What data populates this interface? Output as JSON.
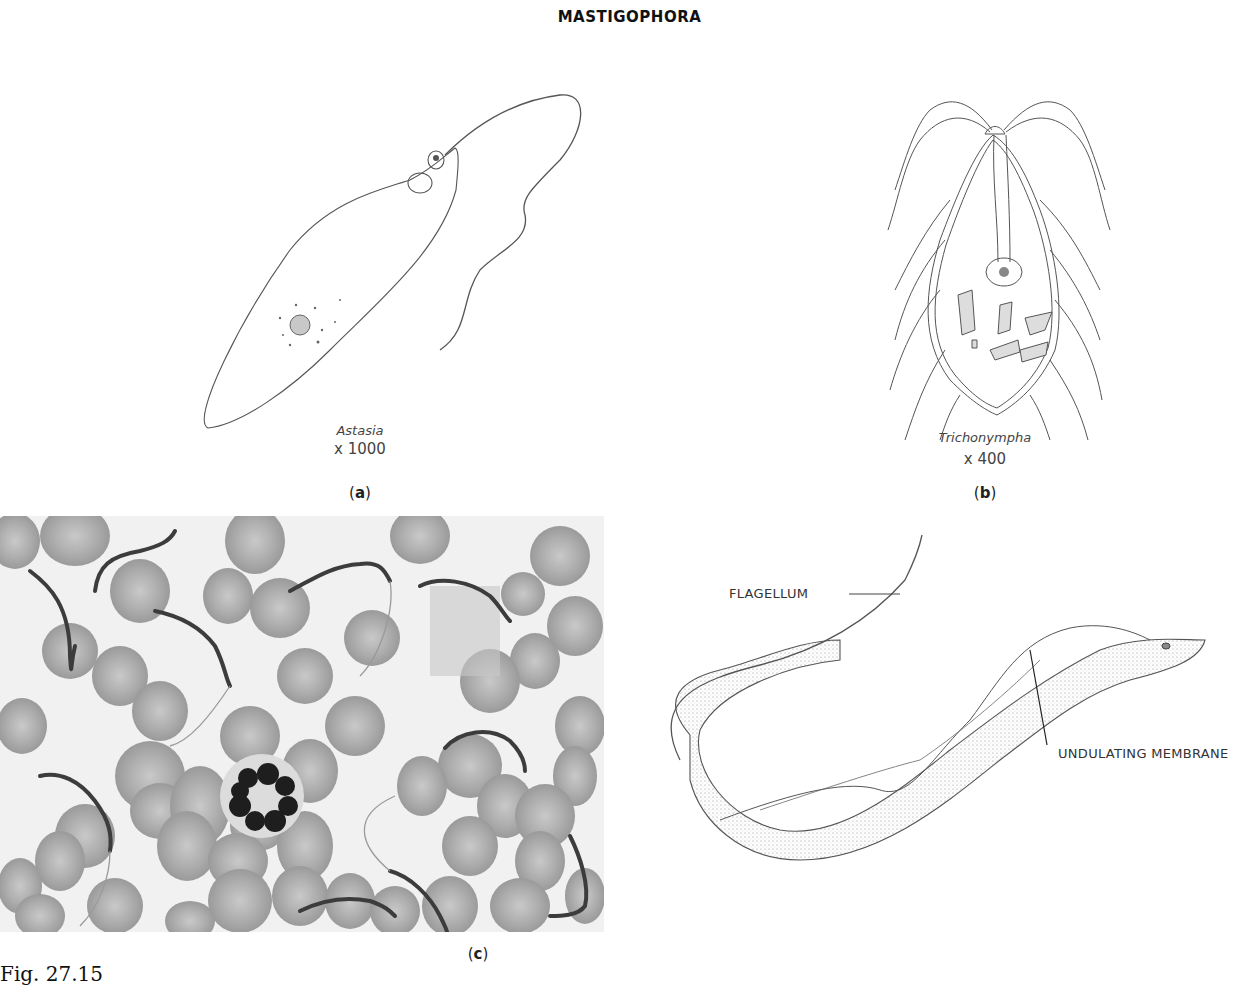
{
  "page": {
    "title": "MASTIGOPHORA",
    "figure_number": "Fig. 27.15"
  },
  "panels": {
    "a": {
      "label_open": "(",
      "label_letter": "a",
      "label_close": ")",
      "organism": "Astasia",
      "magnification": "x 1000",
      "type": "line drawing"
    },
    "b": {
      "label_open": "(",
      "label_letter": "b",
      "label_close": ")",
      "organism": "Trichonympha",
      "magnification": "x 400",
      "type": "line drawing"
    },
    "c": {
      "label_open": "(",
      "label_letter": "c",
      "label_close": ")",
      "photo_description": "Micrograph of blood smear with trypanosomes among red blood cells and a neutrophil",
      "diagram_callouts": {
        "flagellum": "FLAGELLUM",
        "undulating_membrane": "UNDULATING MEMBRANE"
      }
    }
  },
  "colors": {
    "line": "#555555",
    "stipple": "#9a9a9a",
    "rbc": "#a8a8a8",
    "photo_bg": "#f1f1f1",
    "nucleus_dark": "#1e1e1e"
  }
}
